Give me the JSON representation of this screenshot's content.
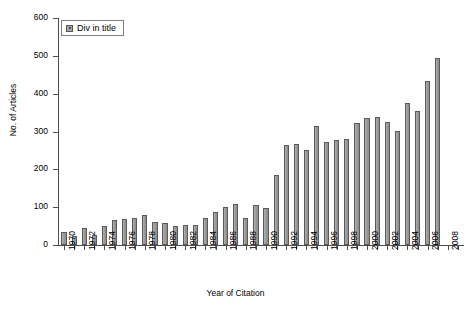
{
  "chart_data": {
    "type": "bar",
    "title": "",
    "xlabel": "Year of Citation",
    "ylabel": "No. of Articles",
    "ylim": [
      0,
      600
    ],
    "ytick_values": [
      0,
      100,
      200,
      300,
      400,
      500,
      600
    ],
    "ytick_labels": [
      "0",
      "100",
      "200",
      "300",
      "400",
      "500",
      "600"
    ],
    "grid": false,
    "legend_position": "top-left",
    "series": [
      {
        "name": "Div in title",
        "color": "#a0a0a0",
        "values": [
          35,
          24,
          45,
          27,
          50,
          66,
          68,
          71,
          80,
          60,
          57,
          50,
          53,
          52,
          71,
          87,
          100,
          108,
          71,
          106,
          98,
          185,
          265,
          267,
          252,
          315,
          272,
          278,
          281,
          323,
          337,
          338,
          325,
          301,
          375,
          355,
          434,
          495
        ]
      }
    ],
    "categories": [
      "1970",
      "1971",
      "1972",
      "1973",
      "1974",
      "1975",
      "1976",
      "1977",
      "1978",
      "1979",
      "1980",
      "1981",
      "1982",
      "1983",
      "1984",
      "1985",
      "1986",
      "1987",
      "1988",
      "1989",
      "1990",
      "1991",
      "1992",
      "1993",
      "1994",
      "1995",
      "1996",
      "1997",
      "1998",
      "1999",
      "2000",
      "2001",
      "2002",
      "2003",
      "2004",
      "2005",
      "2006",
      "2007"
    ],
    "xtick_labels_shown": [
      "1970",
      "1972",
      "1974",
      "1976",
      "1978",
      "1980",
      "1982",
      "1984",
      "1986",
      "1988",
      "1990",
      "1992",
      "1994",
      "1996",
      "1998",
      "2000",
      "2002",
      "2004",
      "2006",
      "2008"
    ]
  },
  "legend": {
    "entries": [
      {
        "label": "Div in title",
        "swatch": "legend-swatch-icon"
      }
    ]
  },
  "axes": {
    "x_title": "Year of Citation",
    "y_title": "No. of Articles"
  }
}
